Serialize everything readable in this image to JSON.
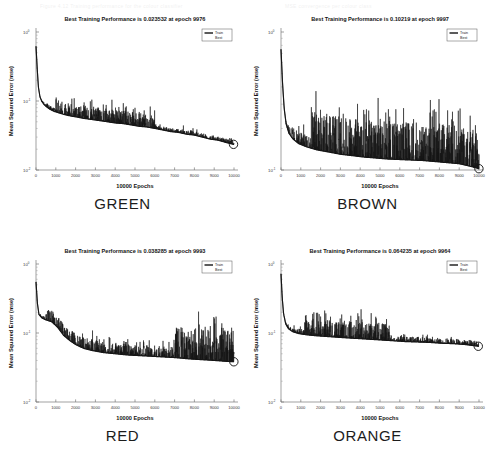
{
  "figure": {
    "width": 490,
    "height": 465,
    "background": "#ffffff",
    "ink_color": "#151515",
    "ghost_header_fragments": [
      "Figure 4.12 Training performance for the colour classifier",
      "MSE convergence per colour class"
    ]
  },
  "common": {
    "ylabel": "Mean Squared Error  (mse)",
    "xlabel": "10000 Epochs",
    "legend": [
      "Train",
      "Best"
    ],
    "xticks": [
      "0",
      "1000",
      "2000",
      "3000",
      "4000",
      "5000",
      "6000",
      "7000",
      "8000",
      "9000",
      "10000"
    ],
    "xlim": [
      0,
      10000
    ],
    "yaxis_scale": "log",
    "best_marker": "circle"
  },
  "panels": [
    {
      "id": "green",
      "color_label": "GREEN",
      "title": "Best Training Performance is 0.023532 at epoch 9976",
      "best_mse": 0.023532,
      "best_epoch": 9976,
      "yticks": [
        "10^0",
        "10^-1",
        "10^-2"
      ],
      "ylim": [
        0.01,
        1
      ]
    },
    {
      "id": "brown",
      "color_label": "BROWN",
      "title": "Best Training Performance is 0.10219 at epoch 9997",
      "best_mse": 0.10219,
      "best_epoch": 9997,
      "yticks": [
        "10^0",
        "10^-1"
      ],
      "ylim": [
        0.1,
        1
      ]
    },
    {
      "id": "red",
      "color_label": "RED",
      "title": "Best Training Performance is 0.038285 at epoch 9993",
      "best_mse": 0.038285,
      "best_epoch": 9993,
      "yticks": [
        "10^0",
        "10^-1",
        "10^-2"
      ],
      "ylim": [
        0.01,
        1
      ]
    },
    {
      "id": "orange",
      "color_label": "ORANGE",
      "title": "Best Training Performance is 0.064235 at epoch 9964",
      "best_mse": 0.064235,
      "best_epoch": 9964,
      "yticks": [
        "10^0",
        "10^-1",
        "10^-2"
      ],
      "ylim": [
        0.01,
        1
      ]
    }
  ],
  "chart_data": [
    {
      "type": "line",
      "id": "green",
      "title": "Best Training Performance is 0.023532 at epoch 9976",
      "xlabel": "10000 Epochs",
      "ylabel": "Mean Squared Error  (mse)",
      "yscale": "log",
      "xlim": [
        0,
        10000
      ],
      "ylim": [
        0.01,
        1
      ],
      "yticks": [
        1,
        0.1,
        0.01
      ],
      "ytick_labels": [
        "10^0",
        "10^-1",
        "10^-2"
      ],
      "xticks": [
        0,
        1000,
        2000,
        3000,
        4000,
        5000,
        6000,
        7000,
        8000,
        9000,
        10000
      ],
      "grid": false,
      "legend": [
        "Train",
        "Best"
      ],
      "legend_position": "upper right",
      "series": [
        {
          "name": "Train",
          "x": [
            0,
            60,
            120,
            200,
            300,
            420,
            560,
            700,
            900,
            1100,
            1400,
            1700,
            2000,
            2400,
            2800,
            3200,
            3600,
            4000,
            4400,
            4800,
            5200,
            5600,
            6000,
            6400,
            6800,
            7200,
            7600,
            8000,
            8400,
            8800,
            9200,
            9600,
            9976
          ],
          "y": [
            0.62,
            0.3,
            0.16,
            0.115,
            0.098,
            0.088,
            0.081,
            0.076,
            0.071,
            0.068,
            0.064,
            0.061,
            0.059,
            0.056,
            0.054,
            0.052,
            0.05,
            0.048,
            0.047,
            0.045,
            0.043,
            0.042,
            0.04,
            0.038,
            0.036,
            0.035,
            0.033,
            0.032,
            0.03,
            0.028,
            0.027,
            0.025,
            0.023532
          ],
          "noise_envelope": 0.55,
          "noise_peak_region": [
            1000,
            6000
          ]
        },
        {
          "name": "Best",
          "x": [
            9976
          ],
          "y": [
            0.023532
          ],
          "marker": "o"
        }
      ]
    },
    {
      "type": "line",
      "id": "brown",
      "title": "Best Training Performance is 0.10219 at epoch 9997",
      "xlabel": "10000 Epochs",
      "ylabel": "Mean Squared Error  (mse)",
      "yscale": "log",
      "xlim": [
        0,
        10000
      ],
      "ylim": [
        0.1,
        1
      ],
      "yticks": [
        1,
        0.1
      ],
      "ytick_labels": [
        "10^0",
        "10^-1"
      ],
      "xticks": [
        0,
        1000,
        2000,
        3000,
        4000,
        5000,
        6000,
        7000,
        8000,
        9000,
        10000
      ],
      "grid": false,
      "legend": [
        "Train",
        "Best"
      ],
      "legend_position": "upper right",
      "series": [
        {
          "name": "Train",
          "x": [
            0,
            80,
            160,
            260,
            400,
            600,
            900,
            1300,
            1800,
            2400,
            3000,
            3600,
            4200,
            4800,
            5400,
            6000,
            6600,
            7200,
            7800,
            8400,
            9000,
            9500,
            9997
          ],
          "y": [
            0.75,
            0.42,
            0.28,
            0.215,
            0.185,
            0.168,
            0.155,
            0.147,
            0.14,
            0.135,
            0.13,
            0.127,
            0.124,
            0.122,
            0.12,
            0.119,
            0.118,
            0.117,
            0.115,
            0.113,
            0.111,
            0.107,
            0.10219
          ],
          "noise_envelope": 0.9,
          "noise_peak_region": [
            1500,
            10000
          ]
        },
        {
          "name": "Best",
          "x": [
            9997
          ],
          "y": [
            0.10219
          ],
          "marker": "o"
        }
      ]
    },
    {
      "type": "line",
      "id": "red",
      "title": "Best Training Performance is 0.038285 at epoch 9993",
      "xlabel": "10000 Epochs",
      "ylabel": "Mean Squared Error  (mse)",
      "yscale": "log",
      "xlim": [
        0,
        10000
      ],
      "ylim": [
        0.01,
        1
      ],
      "yticks": [
        1,
        0.1,
        0.01
      ],
      "ytick_labels": [
        "10^0",
        "10^-1",
        "10^-2"
      ],
      "xticks": [
        0,
        1000,
        2000,
        3000,
        4000,
        5000,
        6000,
        7000,
        8000,
        9000,
        10000
      ],
      "grid": false,
      "legend": [
        "Train",
        "Best"
      ],
      "legend_position": "upper right",
      "series": [
        {
          "name": "Train",
          "x": [
            0,
            70,
            150,
            300,
            500,
            800,
            1100,
            1400,
            1700,
            2000,
            2400,
            2800,
            3400,
            4000,
            4600,
            5200,
            5800,
            6400,
            7000,
            7400,
            7800,
            8400,
            9000,
            9500,
            9993
          ],
          "y": [
            0.55,
            0.27,
            0.185,
            0.165,
            0.155,
            0.145,
            0.12,
            0.092,
            0.078,
            0.068,
            0.06,
            0.056,
            0.052,
            0.05,
            0.048,
            0.047,
            0.046,
            0.045,
            0.044,
            0.043,
            0.042,
            0.041,
            0.04,
            0.039,
            0.038285
          ],
          "noise_envelope": 1.8,
          "noise_peak_region": [
            7000,
            10000
          ]
        },
        {
          "name": "Best",
          "x": [
            9993
          ],
          "y": [
            0.038285
          ],
          "marker": "o"
        }
      ]
    },
    {
      "type": "line",
      "id": "orange",
      "title": "Best Training Performance is 0.064235 at epoch 9964",
      "xlabel": "10000 Epochs",
      "ylabel": "Mean Squared Error  (mse)",
      "yscale": "log",
      "xlim": [
        0,
        10000
      ],
      "ylim": [
        0.01,
        1
      ],
      "yticks": [
        1,
        0.1,
        0.01
      ],
      "ytick_labels": [
        "10^0",
        "10^-1",
        "10^-2"
      ],
      "xticks": [
        0,
        1000,
        2000,
        3000,
        4000,
        5000,
        6000,
        7000,
        8000,
        9000,
        10000
      ],
      "grid": false,
      "legend": [
        "Train",
        "Best"
      ],
      "legend_position": "upper right",
      "series": [
        {
          "name": "Train",
          "x": [
            0,
            60,
            130,
            240,
            380,
            600,
            900,
            1300,
            1800,
            2300,
            2800,
            3300,
            3900,
            4500,
            5100,
            5700,
            6300,
            6900,
            7500,
            8100,
            8700,
            9300,
            9964
          ],
          "y": [
            0.72,
            0.33,
            0.19,
            0.135,
            0.115,
            0.104,
            0.098,
            0.094,
            0.091,
            0.089,
            0.087,
            0.085,
            0.083,
            0.081,
            0.079,
            0.077,
            0.075,
            0.074,
            0.073,
            0.071,
            0.07,
            0.068,
            0.064235
          ],
          "noise_envelope": 0.75,
          "noise_peak_region": [
            1200,
            5500
          ]
        },
        {
          "name": "Best",
          "x": [
            9964
          ],
          "y": [
            0.064235
          ],
          "marker": "o"
        }
      ]
    }
  ]
}
